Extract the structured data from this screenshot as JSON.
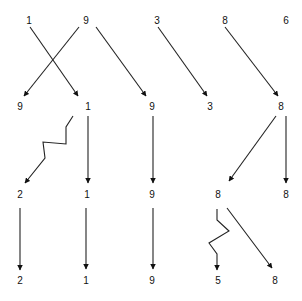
{
  "diagram": {
    "rows": [
      {
        "name": "row-1",
        "y": 21,
        "labels": [
          {
            "text": "1",
            "x": 29
          },
          {
            "text": "9",
            "x": 86
          },
          {
            "text": "3",
            "x": 157
          },
          {
            "text": "8",
            "x": 225
          },
          {
            "text": "6",
            "x": 286
          }
        ]
      },
      {
        "name": "row-2",
        "y": 107,
        "labels": [
          {
            "text": "9",
            "x": 20
          },
          {
            "text": "1",
            "x": 88
          },
          {
            "text": "9",
            "x": 152
          },
          {
            "text": "3",
            "x": 210
          },
          {
            "text": "8",
            "x": 281
          }
        ]
      },
      {
        "name": "row-3",
        "y": 195,
        "labels": [
          {
            "text": "2",
            "x": 20
          },
          {
            "text": "1",
            "x": 87
          },
          {
            "text": "9",
            "x": 152
          },
          {
            "text": "8",
            "x": 218
          },
          {
            "text": "8",
            "x": 286
          }
        ]
      },
      {
        "name": "row-4",
        "y": 281,
        "labels": [
          {
            "text": "2",
            "x": 20
          },
          {
            "text": "1",
            "x": 86
          },
          {
            "text": "9",
            "x": 152
          },
          {
            "text": "5",
            "x": 218
          },
          {
            "text": "8",
            "x": 275
          }
        ]
      }
    ],
    "arrows": [
      {
        "name": "arrow-1-to-1",
        "points": "30,27 78,96"
      },
      {
        "name": "arrow-9-to-9",
        "points": "79,27 24,96"
      },
      {
        "name": "arrow-9-to-9b",
        "points": "96,27 146,96"
      },
      {
        "name": "arrow-3-to-3",
        "points": "158,27 207,96"
      },
      {
        "name": "arrow-8-to-8",
        "points": "225,27 278,96"
      },
      {
        "name": "arrow-1-zigzag-to-2",
        "points": "73,116 66,127 66,144 43,142 45,158 25,183"
      },
      {
        "name": "arrow-1-to-1-row3",
        "points": "88,116 88,183"
      },
      {
        "name": "arrow-9-to-9-row3",
        "points": "153,116 153,183"
      },
      {
        "name": "arrow-8-to-8-row3",
        "points": "276,116 229,181"
      },
      {
        "name": "arrow-8-to-8b-row3",
        "points": "286,116 286,183"
      },
      {
        "name": "arrow-2-to-2",
        "points": "20,208 20,270"
      },
      {
        "name": "arrow-1-to-1-row4",
        "points": "86,208 86,269"
      },
      {
        "name": "arrow-9-to-9-row4",
        "points": "153,208 153,269"
      },
      {
        "name": "arrow-8-zigzag-to-5",
        "points": "217,209 217,220 229,231 209,243 217,254 217,270"
      },
      {
        "name": "arrow-8-to-8-row4",
        "points": "227,208 272,268"
      }
    ],
    "colors": {
      "line": "#222222",
      "text": "#111111",
      "background": "#ffffff"
    }
  }
}
